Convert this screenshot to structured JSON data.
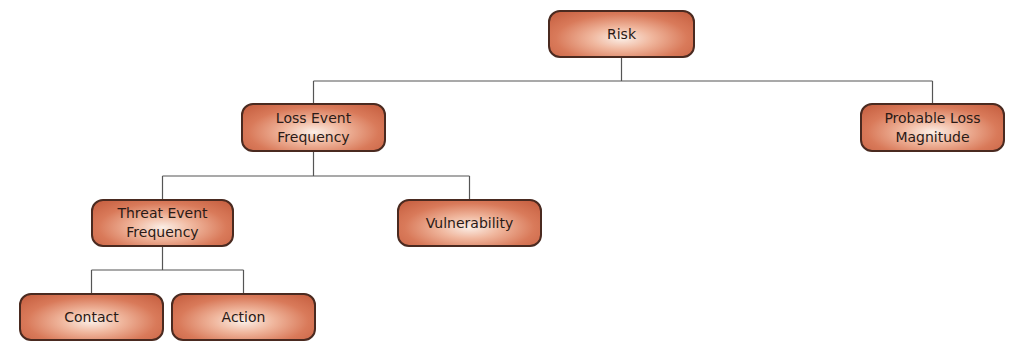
{
  "diagram": {
    "line_color": "#555555",
    "node_fill": "#d97a5a",
    "node_border": "#4a2a20",
    "nodes": {
      "risk": {
        "label": "Risk"
      },
      "loss_event_frequency": {
        "label": "Loss Event\nFrequency"
      },
      "probable_loss_magnitude": {
        "label": "Probable Loss\nMagnitude"
      },
      "threat_event_frequency": {
        "label": "Threat Event\nFrequency"
      },
      "vulnerability": {
        "label": "Vulnerability"
      },
      "contact": {
        "label": "Contact"
      },
      "action": {
        "label": "Action"
      }
    },
    "edges": [
      {
        "parent": "risk",
        "children": [
          "loss_event_frequency",
          "probable_loss_magnitude"
        ]
      },
      {
        "parent": "loss_event_frequency",
        "children": [
          "threat_event_frequency",
          "vulnerability"
        ]
      },
      {
        "parent": "threat_event_frequency",
        "children": [
          "contact",
          "action"
        ]
      }
    ]
  }
}
